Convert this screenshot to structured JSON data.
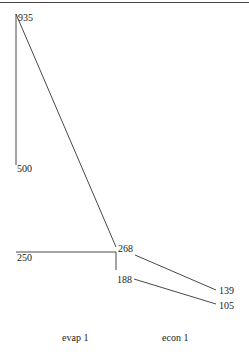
{
  "chart_data": {
    "type": "line",
    "title": "",
    "xlabel": "",
    "ylabel": "",
    "categories": [
      "evap 1",
      "econ 1"
    ],
    "points": [
      {
        "id": "p935",
        "label": "935",
        "value": 935
      },
      {
        "id": "p500",
        "label": "500",
        "value": 500
      },
      {
        "id": "p250",
        "label": "250",
        "value": 250
      },
      {
        "id": "p268",
        "label": "268",
        "value": 268
      },
      {
        "id": "p188",
        "label": "188",
        "value": 188
      },
      {
        "id": "p139",
        "label": "139",
        "value": 139
      },
      {
        "id": "p105",
        "label": "105",
        "value": 105
      }
    ],
    "segments": [
      {
        "from": "935",
        "to": "500"
      },
      {
        "from": "935",
        "to": "268"
      },
      {
        "from": "250",
        "to": "268"
      },
      {
        "from": "268",
        "to": "188"
      },
      {
        "from": "268",
        "to": "139"
      },
      {
        "from": "188",
        "to": "105"
      }
    ],
    "grid": false,
    "legend": "none"
  }
}
